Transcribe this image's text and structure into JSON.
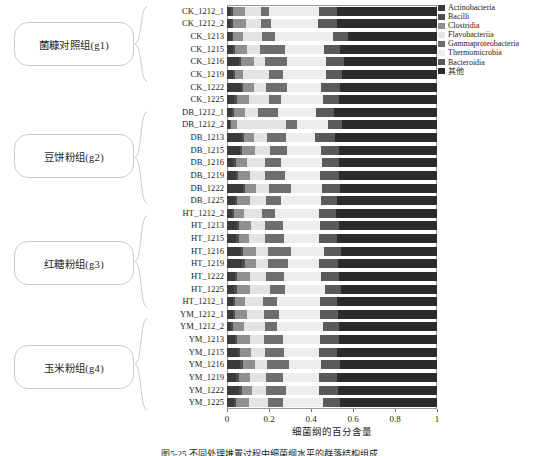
{
  "figure": {
    "caption": "图5-25  不同处理堆置过程中细菌纲水平的群落结构组成",
    "xaxis_title": "细菌纲的百分含量",
    "xticks": [
      "0",
      "0.2",
      "0.4",
      "0.6",
      "0.8",
      "1"
    ]
  },
  "groups": [
    {
      "label": "菌糠对照组(g1)",
      "prefix": "CK"
    },
    {
      "label": "豆饼粉组(g2)",
      "prefix": "DB"
    },
    {
      "label": "红糖粉组(g3)",
      "prefix": "HT"
    },
    {
      "label": "玉米粉组(g4)",
      "prefix": "YM"
    }
  ],
  "legend": {
    "items": [
      {
        "label": "Actinobacteria",
        "color": "#3b3b3b"
      },
      {
        "label": "Bacilli",
        "color": "#4e4e4e"
      },
      {
        "label": "Clostridia",
        "color": "#8f8f8f"
      },
      {
        "label": "Flavobacteriia",
        "color": "#e3e3e3"
      },
      {
        "label": "Gammaproteobacteria",
        "color": "#6e6e6e"
      },
      {
        "label": "Thermomicrobia",
        "color": "#ededed"
      },
      {
        "label": "Bacteroidia",
        "color": "#5a5a5a"
      },
      {
        "label": "其他",
        "color": "#2b2b2b"
      }
    ]
  },
  "chart_data": {
    "type": "bar",
    "orientation": "horizontal",
    "stacked": true,
    "normalized": true,
    "title": "",
    "xlabel": "细菌纲的百分含量",
    "ylabel": "",
    "xlim": [
      0,
      1
    ],
    "xticks": [
      0,
      0.2,
      0.4,
      0.6,
      0.8,
      1
    ],
    "grid": false,
    "legend_position": "right",
    "series": [
      {
        "name": "Actinobacteria",
        "color": "#3b3b3b"
      },
      {
        "name": "Bacilli",
        "color": "#4e4e4e"
      },
      {
        "name": "Clostridia",
        "color": "#8f8f8f"
      },
      {
        "name": "Flavobacteriia",
        "color": "#e3e3e3"
      },
      {
        "name": "Gammaproteobacteria",
        "color": "#6e6e6e"
      },
      {
        "name": "Thermomicrobia",
        "color": "#ededed"
      },
      {
        "name": "Bacteroidia",
        "color": "#5a5a5a"
      },
      {
        "name": "其他",
        "color": "#2b2b2b"
      }
    ],
    "categories": [
      "CK_1212_1",
      "CK_1212_2",
      "CK_1213",
      "CK_1215",
      "CK_1216",
      "CK_1219",
      "CK_1222",
      "CK_1225",
      "DB_1212_1",
      "DB_1212_2",
      "DB_1213",
      "DB_1215",
      "DB_1216",
      "DB_1219",
      "DB_1222",
      "DB_1225",
      "HT_1212_2",
      "HT_1213",
      "HT_1215",
      "HT_1216",
      "HT_1219",
      "HT_1222",
      "HT_1225",
      "HT_1212_1",
      "YM_1212_1",
      "YM_1212_2",
      "YM_1213",
      "YM_1215",
      "YM_1216",
      "YM_1219",
      "YM_1222",
      "YM_1225"
    ],
    "values": [
      [
        0.02,
        0.01,
        0.055,
        0.075,
        0.04,
        0.24,
        0.085,
        0.475
      ],
      [
        0.018,
        0.012,
        0.06,
        0.07,
        0.048,
        0.225,
        0.09,
        0.477
      ],
      [
        0.022,
        0.008,
        0.048,
        0.09,
        0.062,
        0.275,
        0.07,
        0.425
      ],
      [
        0.028,
        0.012,
        0.055,
        0.06,
        0.12,
        0.185,
        0.08,
        0.46
      ],
      [
        0.055,
        0.01,
        0.065,
        0.05,
        0.105,
        0.185,
        0.085,
        0.445
      ],
      [
        0.03,
        0.008,
        0.04,
        0.12,
        0.07,
        0.205,
        0.075,
        0.452
      ],
      [
        0.068,
        0.01,
        0.052,
        0.055,
        0.1,
        0.165,
        0.09,
        0.46
      ],
      [
        0.035,
        0.012,
        0.058,
        0.095,
        0.055,
        0.2,
        0.08,
        0.465
      ],
      [
        0.025,
        0.01,
        0.05,
        0.065,
        0.095,
        0.18,
        0.085,
        0.49
      ],
      [
        0.012,
        0.008,
        0.03,
        0.23,
        0.055,
        0.145,
        0.07,
        0.45
      ],
      [
        0.07,
        0.012,
        0.048,
        0.06,
        0.09,
        0.14,
        0.095,
        0.485
      ],
      [
        0.06,
        0.01,
        0.062,
        0.075,
        0.08,
        0.16,
        0.088,
        0.465
      ],
      [
        0.03,
        0.012,
        0.055,
        0.085,
        0.075,
        0.195,
        0.082,
        0.466
      ],
      [
        0.042,
        0.01,
        0.058,
        0.07,
        0.095,
        0.17,
        0.09,
        0.465
      ],
      [
        0.075,
        0.012,
        0.05,
        0.062,
        0.105,
        0.15,
        0.085,
        0.461
      ],
      [
        0.038,
        0.01,
        0.06,
        0.08,
        0.068,
        0.19,
        0.078,
        0.476
      ],
      [
        0.022,
        0.012,
        0.045,
        0.09,
        0.06,
        0.21,
        0.08,
        0.481
      ],
      [
        0.048,
        0.01,
        0.055,
        0.07,
        0.085,
        0.175,
        0.09,
        0.467
      ],
      [
        0.045,
        0.012,
        0.05,
        0.075,
        0.09,
        0.168,
        0.085,
        0.475
      ],
      [
        0.068,
        0.01,
        0.058,
        0.06,
        0.11,
        0.155,
        0.08,
        0.459
      ],
      [
        0.072,
        0.012,
        0.052,
        0.058,
        0.095,
        0.148,
        0.092,
        0.471
      ],
      [
        0.04,
        0.01,
        0.06,
        0.078,
        0.082,
        0.18,
        0.085,
        0.465
      ],
      [
        0.035,
        0.012,
        0.062,
        0.095,
        0.07,
        0.195,
        0.075,
        0.456
      ],
      [
        0.03,
        0.01,
        0.048,
        0.085,
        0.065,
        0.205,
        0.082,
        0.475
      ],
      [
        0.028,
        0.012,
        0.055,
        0.08,
        0.072,
        0.198,
        0.085,
        0.47
      ],
      [
        0.02,
        0.01,
        0.05,
        0.1,
        0.06,
        0.215,
        0.078,
        0.467
      ],
      [
        0.038,
        0.012,
        0.058,
        0.07,
        0.088,
        0.178,
        0.09,
        0.466
      ],
      [
        0.052,
        0.01,
        0.052,
        0.065,
        0.095,
        0.165,
        0.085,
        0.476
      ],
      [
        0.062,
        0.012,
        0.06,
        0.058,
        0.105,
        0.152,
        0.088,
        0.463
      ],
      [
        0.045,
        0.01,
        0.055,
        0.075,
        0.08,
        0.175,
        0.082,
        0.478
      ],
      [
        0.058,
        0.012,
        0.05,
        0.068,
        0.092,
        0.16,
        0.09,
        0.47
      ],
      [
        0.035,
        0.01,
        0.062,
        0.088,
        0.072,
        0.19,
        0.08,
        0.463
      ]
    ]
  }
}
